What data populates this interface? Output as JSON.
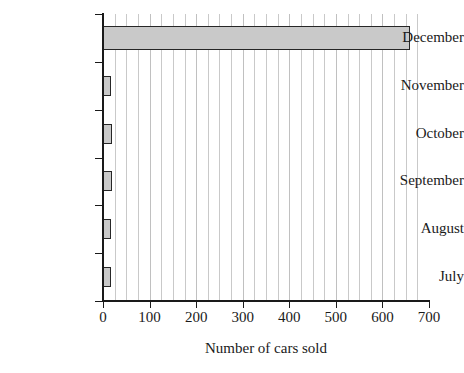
{
  "chart_data": {
    "type": "bar",
    "orientation": "horizontal",
    "title": "",
    "xlabel": "Number of cars sold",
    "ylabel": "",
    "categories": [
      "July",
      "August",
      "September",
      "October",
      "November",
      "December"
    ],
    "values": [
      18,
      18,
      20,
      20,
      18,
      660
    ],
    "xlim": [
      0,
      700
    ],
    "xticks": [
      0,
      100,
      200,
      300,
      400,
      500,
      600,
      700
    ],
    "xtick_labels": [
      "0",
      "100",
      "200",
      "300",
      "400",
      "500",
      "600",
      "700"
    ],
    "minor_tick_interval": 25,
    "grid": "vertical-minor-and-major",
    "legend": "none",
    "series": [
      {
        "name": "Cars sold",
        "values": [
          18,
          18,
          20,
          20,
          18,
          660
        ]
      }
    ],
    "colors": {
      "bar_fill": "#c9c9c9",
      "bar_border": "#262626",
      "gridline": "#c9c9c9",
      "axis": "#1a1a1a",
      "background": "#ffffff",
      "text": "#1a1a1a"
    }
  }
}
